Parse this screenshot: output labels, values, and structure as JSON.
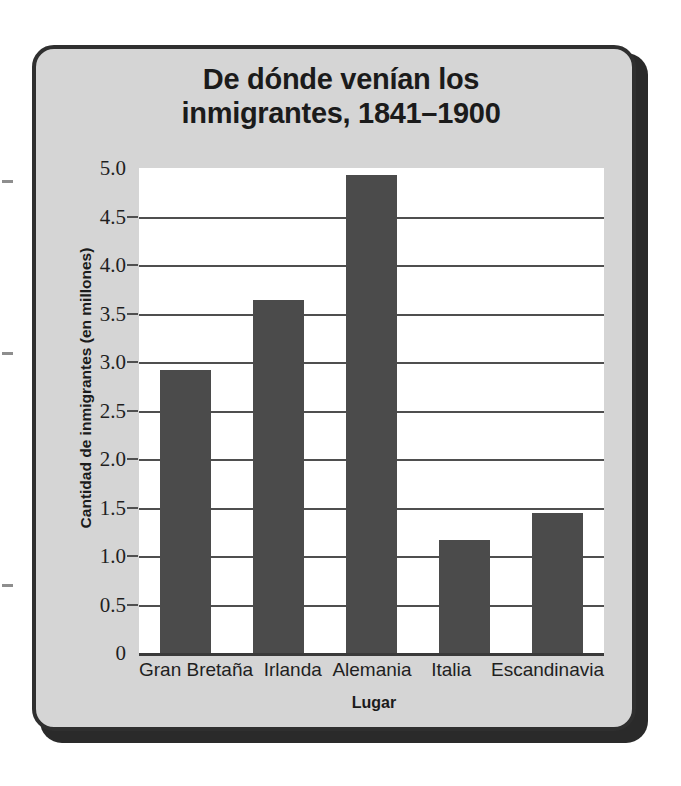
{
  "chart_data": {
    "type": "bar",
    "title": "De dónde venían los inmigrantes, 1841–1900",
    "title_line1": "De dónde venían los",
    "title_line2": "inmigrantes, 1841–1900",
    "xlabel": "Lugar",
    "ylabel": "Cantidad de inmigrantes (en millones)",
    "categories": [
      "Gran Bretaña",
      "Irlanda",
      "Alemania",
      "Italia",
      "Escandinavia"
    ],
    "values": [
      2.92,
      3.64,
      4.93,
      1.17,
      1.44
    ],
    "ylim": [
      0,
      5.0
    ],
    "ytick_labels": [
      "5.0",
      "4.5",
      "4.0",
      "3.5",
      "3.0",
      "2.5",
      "2.0",
      "1.5",
      "1.0",
      "0.5",
      "0"
    ],
    "ytick_values": [
      5.0,
      4.5,
      4.0,
      3.5,
      3.0,
      2.5,
      2.0,
      1.5,
      1.0,
      0.5,
      0
    ],
    "grid": true,
    "legend": "none",
    "bar_color": "#4b4b4b",
    "plot_background": "#ffffff",
    "figure_background": "#d5d5d5",
    "frame_color": "#2f2f2f"
  }
}
